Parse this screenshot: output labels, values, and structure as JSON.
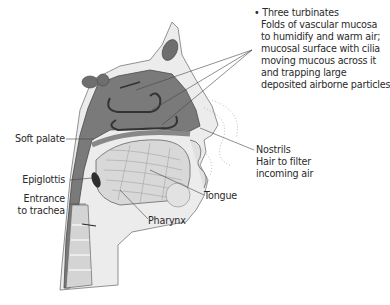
{
  "figure": {
    "colors": {
      "airway": "#7a7a7a",
      "tissue_light": "#e6e6e6",
      "tissue_mid": "#c8c8c8",
      "outline": "#555555",
      "leader_line": "#444444",
      "text": "#2a2a2a",
      "background": "#ffffff"
    }
  },
  "labels": {
    "turbinates": {
      "bullet": "•",
      "lines": [
        "Three turbinates",
        "Folds of vascular mucosa",
        "to humidify and warm air;",
        "mucosal surface with cilia",
        "moving mucous across it",
        "and trapping large",
        "deposited airborne particles"
      ]
    },
    "soft_palate": "Soft palate",
    "epiglottis": "Epiglottis",
    "entrance_to_trachea": [
      "Entrance",
      "to trachea"
    ],
    "nostrils": [
      "Nostrils",
      "Hair to filter",
      "incoming air"
    ],
    "tongue": "Tongue",
    "pharynx": "Pharynx"
  }
}
